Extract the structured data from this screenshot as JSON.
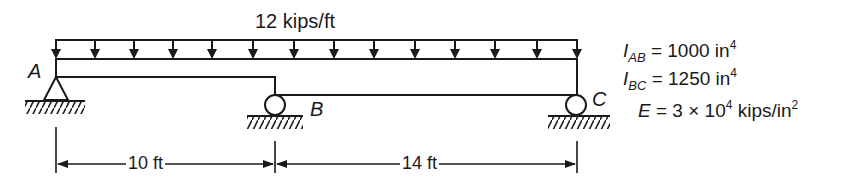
{
  "diagram": {
    "type": "continuous beam",
    "load": {
      "label": "12 kips/ft",
      "kind": "uniformly distributed",
      "magnitude": 12,
      "units": "kips/ft"
    },
    "nodes": {
      "A": "A",
      "B": "B",
      "C": "C"
    },
    "supports": [
      {
        "node": "A",
        "type": "pin"
      },
      {
        "node": "B",
        "type": "roller"
      },
      {
        "node": "C",
        "type": "roller"
      }
    ],
    "spans": [
      {
        "name": "AB",
        "label": "10 ft",
        "length": 10
      },
      {
        "name": "BC",
        "label": "14 ft",
        "length": 14
      }
    ],
    "properties": {
      "I_AB": {
        "symbol": "I",
        "sub": "AB",
        "eq": "= 1000 in",
        "exp": "4"
      },
      "I_BC": {
        "symbol": "I",
        "sub": "BC",
        "eq": "= 1250 in",
        "exp": "4"
      },
      "E": {
        "symbol": "E",
        "eq_a": "= 3 × 10",
        "exp_a": "4",
        "eq_b": " kips/in",
        "exp_b": "2"
      }
    }
  }
}
